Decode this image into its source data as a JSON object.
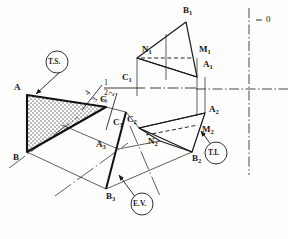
{
  "figure": {
    "type": "descriptive-geometry-construction",
    "background_color": "#fdfdfb",
    "line_color": "#1a1a1a",
    "fill_pattern_color": "#8a8a8a"
  },
  "points": {
    "top_view": [
      {
        "id": "A",
        "label": "A",
        "x": 18,
        "y": 88
      },
      {
        "id": "B",
        "label": "B",
        "x": 17,
        "y": 158
      },
      {
        "id": "C",
        "label": "C",
        "x": 104,
        "y": 100
      }
    ],
    "front_view": [
      {
        "id": "A1",
        "label": "A",
        "sub": "1",
        "x": 205,
        "y": 65
      },
      {
        "id": "B1",
        "label": "B",
        "sub": "1",
        "x": 188,
        "y": 12
      },
      {
        "id": "C1",
        "label": "C",
        "sub": "1",
        "x": 124,
        "y": 78
      },
      {
        "id": "M1",
        "label": "M",
        "sub": "1",
        "x": 203,
        "y": 51
      },
      {
        "id": "N1",
        "label": "N",
        "sub": "1",
        "x": 147,
        "y": 50
      }
    ],
    "aux_view_2": [
      {
        "id": "A2",
        "label": "A",
        "sub": "2",
        "x": 213,
        "y": 110
      },
      {
        "id": "B2",
        "label": "B",
        "sub": "2",
        "x": 196,
        "y": 158
      },
      {
        "id": "C2",
        "label": "C",
        "sub": "2",
        "x": 131,
        "y": 120
      },
      {
        "id": "M2",
        "label": "M",
        "sub": "2",
        "x": 206,
        "y": 130
      },
      {
        "id": "N2",
        "label": "N",
        "sub": "2",
        "x": 152,
        "y": 141
      }
    ],
    "aux_view_3": [
      {
        "id": "A3",
        "label": "A",
        "sub": "3",
        "x": 100,
        "y": 145
      },
      {
        "id": "B3",
        "label": "B",
        "sub": "3",
        "x": 110,
        "y": 196
      },
      {
        "id": "C3",
        "label": "C",
        "sub": "3",
        "x": 117,
        "y": 123
      }
    ]
  },
  "fold_lines": [
    {
      "id": "fold-1-2",
      "upper": "1",
      "lower": "2",
      "orientation": "horizontal",
      "x": 106,
      "y": 88
    },
    {
      "id": "fold-4-3",
      "upper": "4",
      "lower": "3",
      "orientation": "diagonal",
      "x": 89,
      "y": 94
    },
    {
      "id": "fold-2-3",
      "upper": "2",
      "lower": "3",
      "orientation": "diagonal",
      "x": 106,
      "y": 98
    }
  ],
  "annotations": [
    {
      "id": "ts",
      "label": "T.S.",
      "meaning": "true size",
      "cx": 57,
      "cy": 62,
      "target_x": 33,
      "target_y": 95
    },
    {
      "id": "ev",
      "label": "E.V.",
      "meaning": "edge view",
      "cx": 142,
      "cy": 204,
      "target_x": 118,
      "target_y": 174
    },
    {
      "id": "tl",
      "label": "T.L",
      "meaning": "true length",
      "cx": 216,
      "cy": 153,
      "target_x": 200,
      "target_y": 132
    }
  ],
  "reference_marks": {
    "origin_label": "0",
    "origin_x": 270,
    "origin_y": 20,
    "vertical_axis_x": 249,
    "horizontal_axis_y": 89
  }
}
